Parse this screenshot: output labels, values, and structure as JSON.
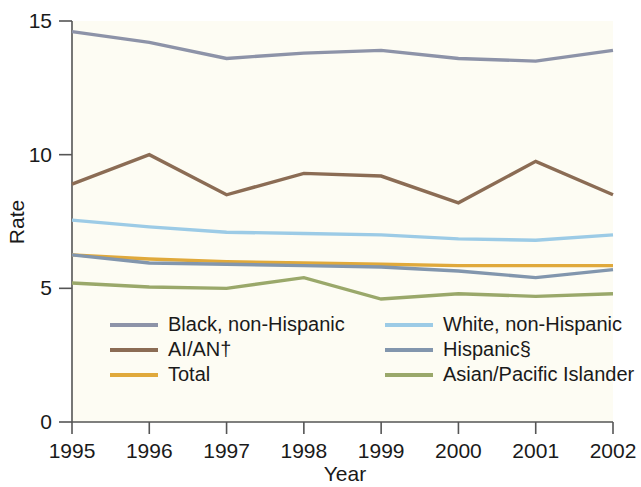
{
  "chart_data": {
    "type": "line",
    "title": "",
    "xlabel": "Year",
    "ylabel": "Rate",
    "categories": [
      "1995",
      "1996",
      "1997",
      "1998",
      "1999",
      "2000",
      "2001",
      "2002"
    ],
    "x": [
      1995,
      1996,
      1997,
      1998,
      1999,
      2000,
      2001,
      2002
    ],
    "xlim": [
      1995,
      2002
    ],
    "ylim": [
      0,
      15
    ],
    "yticks": [
      0,
      5,
      10,
      15
    ],
    "ytick_labels": [
      "0",
      "5",
      "10",
      "15"
    ],
    "grid": false,
    "legend_position": "inside-bottom-left",
    "series": [
      {
        "name": "Black, non-Hispanic",
        "color": "#8d93a8",
        "values": [
          14.6,
          14.2,
          13.6,
          13.8,
          13.9,
          13.6,
          13.5,
          13.9
        ]
      },
      {
        "name": "AI/AN†",
        "color": "#8b6c54",
        "values": [
          8.9,
          10.0,
          8.5,
          9.3,
          9.2,
          8.2,
          9.75,
          8.5
        ]
      },
      {
        "name": "Total",
        "color": "#e0a93b",
        "values": [
          6.25,
          6.1,
          6.0,
          5.95,
          5.9,
          5.85,
          5.85,
          5.85
        ]
      },
      {
        "name": "White, non-Hispanic",
        "color": "#9ccbe6",
        "values": [
          7.55,
          7.3,
          7.1,
          7.05,
          7.0,
          6.85,
          6.8,
          7.0
        ]
      },
      {
        "name": "Hispanic§",
        "color": "#8296ad",
        "values": [
          6.25,
          5.95,
          5.9,
          5.85,
          5.8,
          5.65,
          5.4,
          5.7
        ]
      },
      {
        "name": "Asian/Pacific Islander",
        "color": "#9aa86a",
        "values": [
          5.2,
          5.05,
          5.0,
          5.4,
          4.6,
          4.8,
          4.7,
          4.8
        ]
      }
    ],
    "legend_layout": {
      "left_column": [
        "Black, non-Hispanic",
        "AI/AN†",
        "Total"
      ],
      "right_column": [
        "White, non-Hispanic",
        "Hispanic§",
        "Asian/Pacific Islander"
      ]
    }
  }
}
